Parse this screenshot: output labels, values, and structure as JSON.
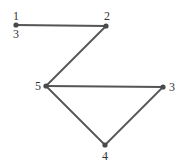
{
  "diagram": {
    "type": "graph",
    "nodes": [
      {
        "id": "n1",
        "x": 16,
        "y": 25,
        "labels": [
          {
            "text": "1",
            "x": 16,
            "y": 20,
            "anchor": "middle"
          },
          {
            "text": "3",
            "x": 16,
            "y": 38,
            "anchor": "middle"
          }
        ]
      },
      {
        "id": "n2",
        "x": 106,
        "y": 26,
        "labels": [
          {
            "text": "2",
            "x": 107,
            "y": 20,
            "anchor": "middle"
          }
        ]
      },
      {
        "id": "n5",
        "x": 46,
        "y": 86,
        "labels": [
          {
            "text": "5",
            "x": 38,
            "y": 90,
            "anchor": "middle"
          }
        ]
      },
      {
        "id": "n3",
        "x": 163,
        "y": 87,
        "labels": [
          {
            "text": "3",
            "x": 172,
            "y": 91,
            "anchor": "middle"
          }
        ]
      },
      {
        "id": "n4",
        "x": 105,
        "y": 145,
        "labels": [
          {
            "text": "4",
            "x": 105,
            "y": 160,
            "anchor": "middle"
          }
        ]
      }
    ],
    "edges": [
      {
        "from": "n1",
        "to": "n2"
      },
      {
        "from": "n2",
        "to": "n5"
      },
      {
        "from": "n5",
        "to": "n3"
      },
      {
        "from": "n5",
        "to": "n4"
      },
      {
        "from": "n3",
        "to": "n4"
      }
    ],
    "colors": {
      "edge": "#555555",
      "node": "#4a4a4a",
      "label": "#333333"
    }
  }
}
